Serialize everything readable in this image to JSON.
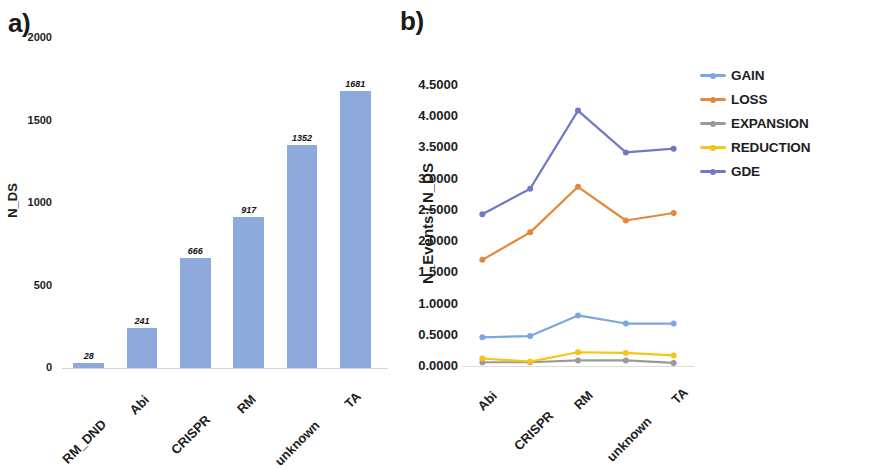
{
  "figure": {
    "panel_a_letter": "a)",
    "panel_b_letter": "b)"
  },
  "panel_a": {
    "ylabel": "N_DS",
    "yticks": [
      "2000",
      "1500",
      "1000",
      "500",
      "0"
    ],
    "categories": [
      "RM_DND",
      "Abi",
      "CRISPR",
      "RM",
      "unknown",
      "TA"
    ],
    "values": [
      28,
      241,
      666,
      917,
      1352,
      1681
    ],
    "value_labels": [
      "28",
      "241",
      "666",
      "917",
      "1352",
      "1681"
    ],
    "bar_color": "#8EA9DB"
  },
  "panel_b": {
    "ylabel": "N_Events / N_DS",
    "yticks": [
      "4.5000",
      "4.0000",
      "3.5000",
      "3.0000",
      "2.5000",
      "2.0000",
      "1.5000",
      "1.0000",
      "0.5000",
      "0.0000"
    ],
    "categories": [
      "Abi",
      "CRISPR",
      "RM",
      "unknown",
      "TA"
    ],
    "legend": [
      {
        "label": "GAIN",
        "color": "#7BA7DC"
      },
      {
        "label": "LOSS",
        "color": "#E08A3C"
      },
      {
        "label": "EXPANSION",
        "color": "#9A9A9A"
      },
      {
        "label": "REDUCTION",
        "color": "#F5C518"
      },
      {
        "label": "GDE",
        "color": "#7179C6"
      }
    ]
  },
  "chart_data": [
    {
      "type": "bar",
      "panel": "a",
      "title": "",
      "xlabel": "",
      "ylabel": "N_DS",
      "categories": [
        "RM_DND",
        "Abi",
        "CRISPR",
        "RM",
        "unknown",
        "TA"
      ],
      "values": [
        28,
        241,
        666,
        917,
        1352,
        1681
      ],
      "ylim": [
        0,
        2000
      ],
      "ytick_values": [
        0,
        500,
        1000,
        1500,
        2000
      ],
      "grid": false,
      "data_labels": true,
      "bar_color": "#8EA9DB"
    },
    {
      "type": "line",
      "panel": "b",
      "title": "",
      "xlabel": "",
      "ylabel": "N_Events / N_DS",
      "categories": [
        "Abi",
        "CRISPR",
        "RM",
        "unknown",
        "TA"
      ],
      "ylim": [
        0.0,
        4.5
      ],
      "ytick_values": [
        0.0,
        0.5,
        1.0,
        1.5,
        2.0,
        2.5,
        3.0,
        3.5,
        4.0,
        4.5
      ],
      "grid": false,
      "legend_position": "right",
      "series": [
        {
          "name": "GAIN",
          "color": "#7BA7DC",
          "values": [
            0.46,
            0.48,
            0.81,
            0.68,
            0.68
          ]
        },
        {
          "name": "LOSS",
          "color": "#E08A3C",
          "values": [
            1.7,
            2.14,
            2.87,
            2.33,
            2.45
          ]
        },
        {
          "name": "EXPANSION",
          "color": "#9A9A9A",
          "values": [
            0.06,
            0.06,
            0.09,
            0.09,
            0.05
          ]
        },
        {
          "name": "REDUCTION",
          "color": "#F5C518",
          "values": [
            0.12,
            0.07,
            0.22,
            0.21,
            0.17
          ]
        },
        {
          "name": "GDE",
          "color": "#7179C6",
          "values": [
            2.43,
            2.84,
            4.09,
            3.42,
            3.48
          ]
        }
      ]
    }
  ]
}
